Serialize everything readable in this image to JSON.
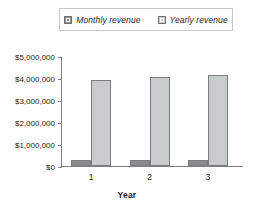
{
  "legend": {
    "entries": [
      {
        "label": "Monthly revenue",
        "swatch": "monthly-swatch-icon",
        "color": "#8a8d8e"
      },
      {
        "label": "Yearly revenue",
        "swatch": "yearly-swatch-icon",
        "color": "#c9cccd"
      }
    ]
  },
  "chart_data": {
    "type": "bar",
    "title": "",
    "xlabel": "Year",
    "ylabel": "",
    "categories": [
      "1",
      "2",
      "3"
    ],
    "series": [
      {
        "name": "Monthly revenue",
        "color": "#8a8d8e",
        "values": [
          270000,
          265000,
          255000
        ]
      },
      {
        "name": "Yearly revenue",
        "color": "#c9cccd",
        "values": [
          3930000,
          4030000,
          4150000
        ]
      }
    ],
    "ylim": [
      0,
      5000000
    ],
    "ytick_values": [
      0,
      1000000,
      2000000,
      3000000,
      4000000,
      5000000
    ],
    "ytick_labels": [
      "$0",
      "$1,000,000",
      "$2,000,000",
      "$3,000,000",
      "$4,000,000",
      "$5,000,000"
    ],
    "grid": false,
    "legend_position": "top"
  },
  "axis": {
    "x_title": "Year"
  }
}
